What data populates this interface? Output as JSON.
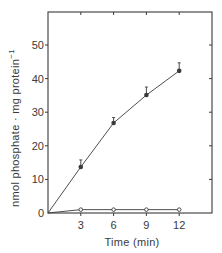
{
  "chart_data": {
    "type": "line",
    "title": "",
    "xlabel": "Time (min)",
    "ylabel": "nmol phosphate · mg protein⁻¹",
    "xlim": [
      0,
      15
    ],
    "ylim": [
      0,
      58
    ],
    "x_ticks": [
      3,
      6,
      9,
      12
    ],
    "y_ticks": [
      0,
      10,
      20,
      30,
      40,
      50
    ],
    "grid": false,
    "legend": null,
    "series": [
      {
        "name": "filled circles",
        "marker": "filled-circle",
        "x": [
          0,
          3,
          6,
          9,
          12
        ],
        "values": [
          0,
          13.7,
          26.8,
          35.1,
          42.3
        ],
        "error_bars": [
          0,
          1.5,
          1.0,
          1.8,
          1.8
        ]
      },
      {
        "name": "open circles",
        "marker": "open-circle",
        "x": [
          0,
          3,
          6,
          9,
          12
        ],
        "values": [
          0,
          1.0,
          1.0,
          1.0,
          1.0
        ]
      }
    ]
  },
  "labels": {
    "x_axis": "Time (min)",
    "y_axis": "nmol phosphate · mg protein",
    "y_axis_exponent": "−1",
    "origin": "0"
  },
  "colors": {
    "ink": "#3a3a3a",
    "background": "#ffffff"
  }
}
